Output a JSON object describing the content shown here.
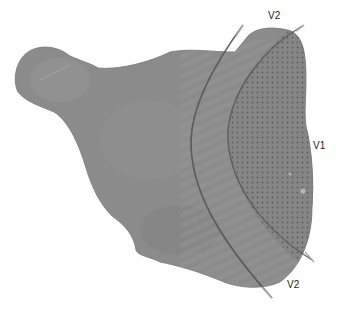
{
  "figure": {
    "labels": {
      "v2_top": "V2",
      "v1": "V1",
      "v2_bottom": "V2"
    },
    "colors": {
      "tissue": "#8e8e8e",
      "v1_region": "#868686",
      "v1_dots": "#5c5c5c",
      "boundary_line": "#555555",
      "guide_line": "#a9a9a9",
      "background": "#ffffff"
    }
  }
}
